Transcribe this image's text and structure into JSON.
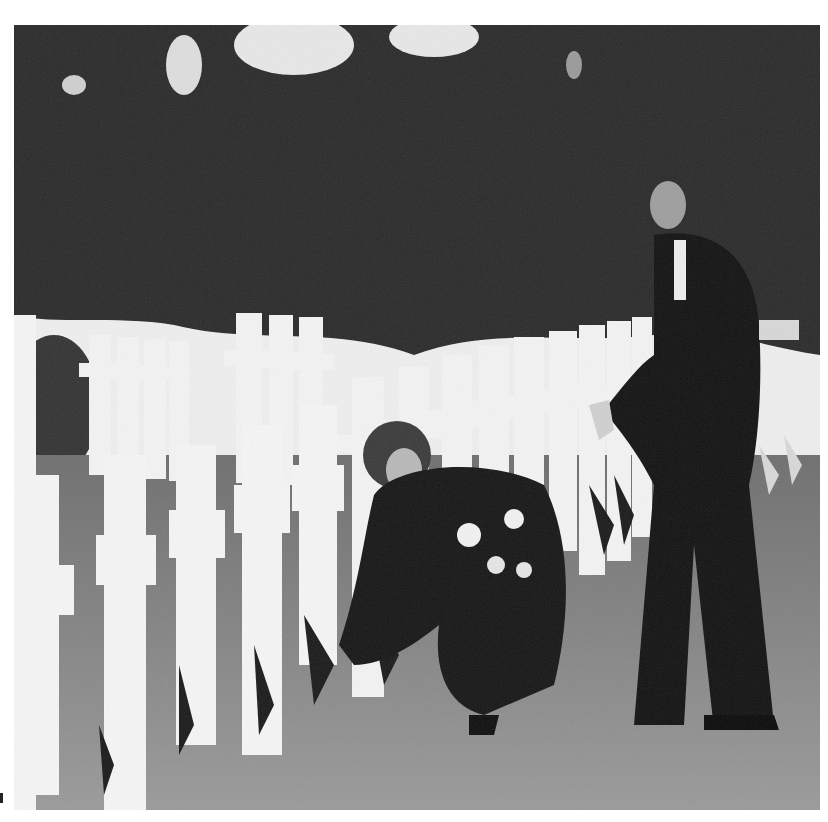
{
  "image": {
    "description": "Black-and-white photograph of a military cemetery with rows of white crosses; a woman kneels placing small American flags at graves while a man in a dark suit stands beside her",
    "palette": {
      "trees": "#2b2b2b",
      "sky": "#f2f2f2",
      "grass": "#8a8a8a",
      "crosses": "#f4f4f4",
      "suits": "#141414"
    }
  }
}
